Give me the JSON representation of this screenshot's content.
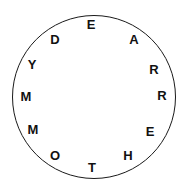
{
  "diagram": {
    "type": "circular-letter-ring",
    "circle": {
      "cx": 92.5,
      "cy": 95.5,
      "r": 81,
      "stroke": "#1a1a1a"
    },
    "text_color": "#111111",
    "letters": [
      {
        "char": "E",
        "x": 91,
        "y": 25
      },
      {
        "char": "A",
        "x": 134,
        "y": 40
      },
      {
        "char": "R",
        "x": 154,
        "y": 70
      },
      {
        "char": "R",
        "x": 162,
        "y": 96
      },
      {
        "char": "E",
        "x": 150,
        "y": 132
      },
      {
        "char": "H",
        "x": 128,
        "y": 156
      },
      {
        "char": "T",
        "x": 92,
        "y": 168
      },
      {
        "char": "O",
        "x": 55,
        "y": 156
      },
      {
        "char": "M",
        "x": 33,
        "y": 130
      },
      {
        "char": "M",
        "x": 26,
        "y": 97
      },
      {
        "char": "Y",
        "x": 32,
        "y": 65
      },
      {
        "char": "D",
        "x": 55,
        "y": 40
      }
    ]
  }
}
